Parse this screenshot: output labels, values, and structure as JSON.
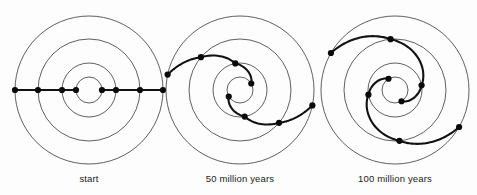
{
  "figure": {
    "background_color": "#fdfdfd",
    "ink_color": "#111111",
    "ring_color": "#2b2b2b",
    "panel_count": 3
  },
  "panels": [
    {
      "id": "panel-start",
      "label": "start",
      "center": {
        "x": 89,
        "y": 90
      },
      "ring_radii": [
        13,
        27,
        51,
        74
      ],
      "label_position": {
        "x": 89,
        "y": 182
      },
      "arms": [
        {
          "id": "arm-a",
          "turns": 0.0,
          "points": [
            {
              "r": 74,
              "theta_deg": 180
            },
            {
              "r": 51,
              "theta_deg": 180
            },
            {
              "r": 27,
              "theta_deg": 180
            },
            {
              "r": 13,
              "theta_deg": 180
            }
          ]
        },
        {
          "id": "arm-b",
          "turns": 0.0,
          "points": [
            {
              "r": 13,
              "theta_deg": 0
            },
            {
              "r": 27,
              "theta_deg": 0
            },
            {
              "r": 51,
              "theta_deg": 0
            },
            {
              "r": 74,
              "theta_deg": 0
            }
          ]
        }
      ],
      "star_count": 8
    },
    {
      "id": "panel-50my",
      "label": "50 million years",
      "center": {
        "x": 240,
        "y": 90
      },
      "ring_radii": [
        13,
        27,
        51,
        74
      ],
      "label_position": {
        "x": 240,
        "y": 182
      },
      "arms": [
        {
          "id": "arm-a",
          "turns": 0.55,
          "points": [
            {
              "r": 74,
              "theta_deg": 168
            },
            {
              "r": 51,
              "theta_deg": 140
            },
            {
              "r": 27,
              "theta_deg": 100
            },
            {
              "r": 13,
              "theta_deg": 30
            }
          ]
        },
        {
          "id": "arm-b",
          "turns": 0.55,
          "points": [
            {
              "r": 13,
              "theta_deg": 210
            },
            {
              "r": 27,
              "theta_deg": 280
            },
            {
              "r": 51,
              "theta_deg": 320
            },
            {
              "r": 74,
              "theta_deg": 348
            }
          ]
        }
      ],
      "star_count": 8
    },
    {
      "id": "panel-100my",
      "label": "100 million years",
      "center": {
        "x": 395,
        "y": 90
      },
      "ring_radii": [
        13,
        27,
        51,
        74
      ],
      "label_position": {
        "x": 395,
        "y": 182
      },
      "arms": [
        {
          "id": "arm-a",
          "turns": 1.1,
          "points": [
            {
              "r": 74,
              "theta_deg": 150
            },
            {
              "r": 51,
              "theta_deg": 95
            },
            {
              "r": 27,
              "theta_deg": 10
            },
            {
              "r": 13,
              "theta_deg": 300
            }
          ]
        },
        {
          "id": "arm-b",
          "turns": 1.1,
          "points": [
            {
              "r": 13,
              "theta_deg": 120
            },
            {
              "r": 27,
              "theta_deg": 190
            },
            {
              "r": 51,
              "theta_deg": 275
            },
            {
              "r": 74,
              "theta_deg": 330
            }
          ]
        }
      ],
      "star_count": 8
    }
  ],
  "style": {
    "star_radius": 3.1,
    "ring_stroke_width": 0.75,
    "arm_stroke_width": 2.1,
    "caption_font_size": 9.5
  }
}
